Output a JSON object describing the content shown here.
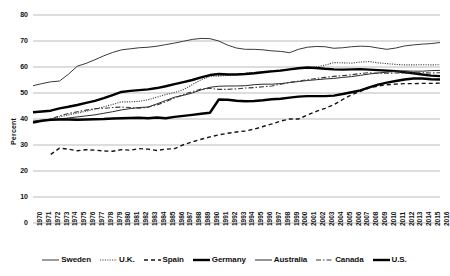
{
  "chart_data": {
    "type": "line",
    "title": "",
    "subtitle": "",
    "xlabel": "",
    "ylabel": "Percent",
    "ylim": [
      0,
      80
    ],
    "ytick_step": 10,
    "yticks": [
      "80",
      "70",
      "60",
      "50",
      "40",
      "30",
      "20",
      "10",
      "0"
    ],
    "grid": true,
    "grid_axis": "y",
    "legend_position": "bottom",
    "x": [
      1970,
      1971,
      1972,
      1973,
      1974,
      1975,
      1976,
      1977,
      1978,
      1979,
      1980,
      1981,
      1982,
      1983,
      1984,
      1985,
      1986,
      1987,
      1988,
      1989,
      1990,
      1991,
      1992,
      1993,
      1994,
      1995,
      1996,
      1997,
      1998,
      1999,
      2000,
      2001,
      2002,
      2003,
      2004,
      2005,
      2006,
      2007,
      2008,
      2009,
      2010,
      2011,
      2012,
      2013,
      2014,
      2015,
      2016
    ],
    "xtick_labels": [
      "1970",
      "1971",
      "1972",
      "1973",
      "1974",
      "1975",
      "1976",
      "1977",
      "1978",
      "1979",
      "1980",
      "1981",
      "1982",
      "1983",
      "1984",
      "1985",
      "1986",
      "1987",
      "1988",
      "1989",
      "1990",
      "1991",
      "1992",
      "1993",
      "1994",
      "1995",
      "1996",
      "1997",
      "1998",
      "1999",
      "2000",
      "2001",
      "2002",
      "2003",
      "2004",
      "2005",
      "2006",
      "2007",
      "2008",
      "2009",
      "2010",
      "2011",
      "2012",
      "2013",
      "2014",
      "2015",
      "2016"
    ],
    "series": [
      {
        "name": "Sweden",
        "style": "solid-thin",
        "color": "#3a3a3a",
        "width": 1.0,
        "dash": "",
        "values": [
          52.8,
          53.6,
          54.3,
          54.6,
          57.2,
          60.3,
          61.4,
          62.8,
          64.3,
          65.6,
          66.6,
          67.0,
          67.4,
          67.6,
          68.0,
          68.6,
          69.2,
          69.9,
          70.6,
          71.0,
          70.9,
          70.0,
          68.4,
          67.3,
          66.8,
          66.8,
          66.6,
          66.2,
          66.0,
          65.5,
          66.8,
          67.6,
          67.9,
          67.8,
          67.2,
          67.4,
          67.8,
          68.0,
          67.9,
          67.3,
          66.8,
          67.3,
          68.1,
          68.5,
          68.8,
          69.0,
          69.4
        ]
      },
      {
        "name": "U.K.",
        "style": "dotted",
        "color": "#4a4a4a",
        "width": 1.1,
        "dash": "1.2,1.2",
        "values": [
          39.0,
          39.5,
          40.0,
          40.8,
          41.6,
          42.3,
          43.0,
          43.8,
          44.7,
          45.6,
          46.6,
          46.6,
          46.8,
          47.4,
          48.4,
          49.4,
          50.2,
          51.3,
          53.2,
          55.1,
          56.4,
          56.5,
          56.8,
          57.2,
          57.6,
          57.9,
          58.2,
          58.6,
          58.8,
          59.0,
          59.5,
          59.8,
          60.0,
          60.7,
          61.7,
          61.6,
          61.5,
          61.9,
          62.1,
          61.6,
          61.3,
          61.0,
          60.8,
          60.8,
          60.9,
          60.8,
          60.9
        ]
      },
      {
        "name": "Spain",
        "style": "dashed",
        "color": "#141414",
        "width": 1.4,
        "dash": "4,3",
        "values": [
          null,
          null,
          26.4,
          28.8,
          28.4,
          27.8,
          28.2,
          28.0,
          27.7,
          27.6,
          28.2,
          28.0,
          28.6,
          28.4,
          27.9,
          28.4,
          28.6,
          30.1,
          31.2,
          32.2,
          33.1,
          33.9,
          34.5,
          35.0,
          35.4,
          36.1,
          37.1,
          38.1,
          39.2,
          40.0,
          40.0,
          41.5,
          42.9,
          44.1,
          45.5,
          47.5,
          49.3,
          50.6,
          52.0,
          52.7,
          53.2,
          53.4,
          53.6,
          53.6,
          53.7,
          53.7,
          53.8
        ]
      },
      {
        "name": "Germany",
        "style": "solid-thick",
        "color": "#000000",
        "width": 2.4,
        "dash": "",
        "values": [
          42.6,
          42.9,
          43.2,
          44.1,
          44.7,
          45.4,
          46.2,
          47.0,
          48.0,
          49.2,
          50.4,
          50.8,
          51.1,
          51.4,
          51.9,
          52.6,
          53.4,
          54.2,
          55.0,
          56.0,
          56.9,
          57.3,
          57.1,
          57.1,
          57.3,
          57.6,
          58.0,
          58.3,
          58.6,
          59.1,
          59.5,
          59.8,
          59.6,
          59.3,
          59.1,
          59.0,
          59.1,
          59.2,
          59.0,
          58.8,
          58.6,
          58.4,
          58.0,
          57.6,
          57.1,
          56.7,
          56.5
        ]
      },
      {
        "name": "Australia",
        "style": "solid-thin",
        "color": "#2a2a2a",
        "width": 1.0,
        "dash": "",
        "values": [
          39.2,
          39.6,
          39.6,
          40.0,
          40.4,
          40.8,
          41.2,
          41.6,
          42.2,
          42.8,
          43.5,
          44.0,
          44.4,
          44.6,
          45.8,
          47.1,
          48.4,
          49.1,
          50.0,
          51.2,
          52.2,
          52.6,
          52.7,
          52.7,
          52.8,
          53.2,
          53.4,
          53.4,
          53.6,
          54.0,
          54.4,
          54.8,
          55.1,
          55.4,
          55.6,
          56.0,
          56.3,
          56.8,
          57.3,
          57.7,
          58.0,
          58.4,
          58.5,
          58.4,
          58.4,
          58.6,
          58.7
        ]
      },
      {
        "name": "Canada",
        "style": "dash-dot",
        "color": "#3a3a3a",
        "width": 1.1,
        "dash": "5,2,1.5,2",
        "values": [
          38.8,
          39.4,
          40.0,
          41.2,
          42.1,
          42.8,
          43.4,
          44.0,
          44.1,
          44.4,
          44.6,
          44.4,
          44.2,
          44.5,
          45.4,
          46.7,
          48.1,
          49.4,
          50.5,
          51.5,
          51.8,
          51.4,
          51.4,
          51.6,
          51.9,
          52.1,
          52.4,
          52.7,
          53.4,
          54.1,
          54.6,
          55.1,
          55.6,
          56.0,
          56.4,
          56.7,
          57.0,
          57.5,
          57.8,
          57.6,
          57.6,
          57.7,
          57.7,
          57.7,
          57.8,
          57.7,
          57.8
        ]
      },
      {
        "name": "U.S.",
        "style": "solid-thick",
        "color": "#000000",
        "width": 2.4,
        "dash": "",
        "values": [
          38.6,
          39.3,
          39.7,
          39.8,
          39.8,
          39.7,
          39.8,
          39.9,
          40.0,
          40.2,
          40.3,
          40.4,
          40.5,
          40.3,
          40.6,
          40.3,
          40.8,
          41.2,
          41.6,
          42.0,
          42.4,
          47.5,
          47.4,
          47.0,
          46.8,
          46.9,
          47.2,
          47.6,
          47.8,
          48.2,
          48.6,
          48.8,
          48.8,
          48.8,
          49.0,
          49.6,
          50.3,
          51.0,
          52.2,
          53.2,
          54.0,
          54.6,
          55.2,
          55.6,
          55.6,
          55.3,
          55.2
        ]
      }
    ]
  }
}
